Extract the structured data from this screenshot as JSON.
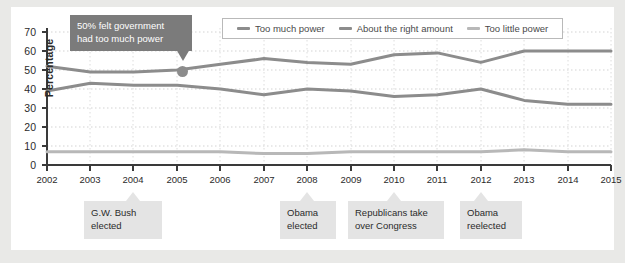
{
  "chart_data": {
    "type": "line",
    "title": "",
    "xlabel": "",
    "ylabel": "Percentage",
    "xlim": [
      2002,
      2015
    ],
    "ylim": [
      0,
      70
    ],
    "grid": true,
    "legend_position": "top-right",
    "x": [
      2002,
      2003,
      2004,
      2005,
      2006,
      2007,
      2008,
      2009,
      2010,
      2011,
      2012,
      2013,
      2014,
      2015
    ],
    "categories": [
      "2002",
      "2003",
      "2004",
      "2005",
      "2006",
      "2007",
      "2008",
      "2009",
      "2010",
      "2011",
      "2012",
      "2013",
      "2014",
      "2015"
    ],
    "yticks": [
      0,
      10,
      20,
      30,
      40,
      50,
      60,
      70
    ],
    "series": [
      {
        "name": "Too much power",
        "color": "#8c8c8c",
        "values": [
          52,
          49,
          49,
          50,
          53,
          56,
          54,
          53,
          58,
          59,
          54,
          60,
          60,
          60
        ]
      },
      {
        "name": "About the right amount",
        "color": "#8c8c8c",
        "values": [
          39,
          43,
          42,
          42,
          40,
          37,
          40,
          39,
          36,
          37,
          40,
          34,
          32,
          32
        ]
      },
      {
        "name": "Too little power",
        "color": "#b8b8b8",
        "values": [
          7,
          7,
          7,
          7,
          7,
          6,
          6,
          7,
          7,
          7,
          7,
          8,
          7,
          7
        ]
      }
    ],
    "annotations": [
      {
        "id": "tooltip-callout",
        "text": "50% felt government had too much power",
        "line1": "50% felt government",
        "line2": "had too much power",
        "point_x": 2005,
        "point_y": 50
      },
      {
        "id": "bush-elected",
        "line1": "G.W. Bush",
        "line2": "elected",
        "point_x": 2004
      },
      {
        "id": "obama-elected",
        "line1": "Obama",
        "line2": "elected",
        "point_x": 2008
      },
      {
        "id": "republicans-congress",
        "line1": "Republicans take",
        "line2": "over Congress",
        "point_x": 2010
      },
      {
        "id": "obama-reelected",
        "line1": "Obama",
        "line2": "reelected",
        "point_x": 2012
      }
    ]
  },
  "legend": {
    "items": [
      {
        "label": "Too much power",
        "color": "#8c8c8c"
      },
      {
        "label": "About the right amount",
        "color": "#8c8c8c"
      },
      {
        "label": "Too little power",
        "color": "#b8b8b8"
      }
    ]
  },
  "axes": {
    "ylabel": "Percentage",
    "yticks": [
      "70",
      "60",
      "50",
      "40",
      "30",
      "20",
      "10",
      "0"
    ],
    "xticks": [
      "2002",
      "2003",
      "2004",
      "2005",
      "2006",
      "2007",
      "2008",
      "2009",
      "2010",
      "2011",
      "2012",
      "2013",
      "2014",
      "2015"
    ]
  },
  "tooltip": {
    "line1": "50% felt government",
    "line2": "had too much power"
  },
  "callouts": [
    {
      "line1": "G.W. Bush",
      "line2": "elected"
    },
    {
      "line1": "Obama",
      "line2": "elected"
    },
    {
      "line1": "Republicans take",
      "line2": "over Congress"
    },
    {
      "line1": "Obama",
      "line2": "reelected"
    }
  ],
  "colors": {
    "background": "#e9e9e7",
    "card": "#ffffff",
    "series_dark": "#8c8c8c",
    "series_light": "#b8b8b8",
    "axis": "#3a3a3a",
    "grid": "#d6d6d6",
    "tooltip_bg": "#7b7b7b",
    "callout_bg": "#e4e4e4"
  }
}
